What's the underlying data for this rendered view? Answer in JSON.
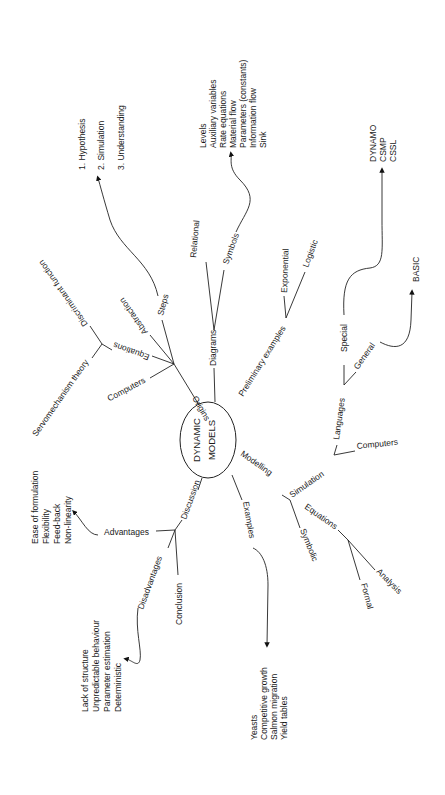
{
  "center": {
    "line1": "DYNAMIC",
    "line2": "MODELS"
  },
  "branches": {
    "origins": {
      "label": "Origins",
      "children": {
        "computers": "Computers",
        "equations": "Equations",
        "abstraction": "Abstraction",
        "steps": "Steps",
        "equations_children": {
          "discriminant": "Discriminant function",
          "servo": "Servomechanism theory"
        },
        "steps_list": [
          "1.  Hypothesis",
          "2.  Simulation",
          "3.  Understanding"
        ]
      }
    },
    "diagrams": {
      "label": "Diagrams",
      "children": {
        "relational": "Relational",
        "symbols": "Symbols",
        "symbols_list": [
          "Levels",
          "Auxiliary variables",
          "Rate equations",
          "Material flow",
          "Parameters (constants)",
          "Information flow",
          "Sink"
        ]
      }
    },
    "preliminary": {
      "label": "Preliminary examples",
      "children": {
        "exponential": "Exponential",
        "logistic": "Logistic"
      }
    },
    "modelling": {
      "label": "Modelling",
      "children": {
        "simulation": "Simulation",
        "symbolic": "Symbolic",
        "simulation_children": {
          "languages": "Languages",
          "computers": "Computers",
          "special": "Special",
          "general": "General",
          "special_list": [
            "DYNAMO",
            "CSMP",
            "CSSL"
          ],
          "general_list": [
            "BASIC"
          ]
        },
        "symbolic_children": {
          "equations": "Equations",
          "formal": "Formal",
          "analysis": "Analysis"
        }
      }
    },
    "examples": {
      "label": "Examples",
      "list": [
        "Yeasts",
        "Competitive growth",
        "Salmon migration",
        "Yield tables"
      ]
    },
    "discussion": {
      "label": "Discussion",
      "children": {
        "advantages": "Advantages",
        "disadvantages": "Disadvantages",
        "conclusion": "Conclusion",
        "advantages_list": [
          "Ease of formulation",
          "Flexibility",
          "Feed-back",
          "Non-linearity"
        ],
        "disadvantages_list": [
          "Lack of structure",
          "Unpredictable behaviour",
          "Parameter estimation",
          "Deterministic"
        ]
      }
    }
  }
}
